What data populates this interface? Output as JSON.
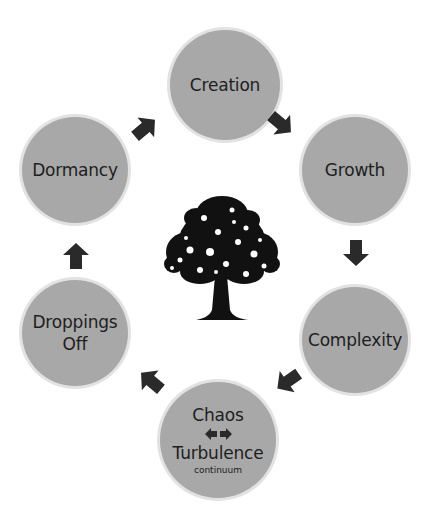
{
  "diagram": {
    "type": "cycle",
    "center_icon": "tree-icon",
    "colors": {
      "node_fill": "#a8a8a8",
      "node_ring": "#e2e2e2",
      "arrow": "#2a2a2a",
      "text": "#1e1e1e"
    },
    "nodes": [
      {
        "id": "creation",
        "label": "Creation"
      },
      {
        "id": "growth",
        "label": "Growth"
      },
      {
        "id": "complexity",
        "label": "Complexity"
      },
      {
        "id": "chaos",
        "label": "Chaos",
        "label2": "Turbulence",
        "sublabel": "continuum",
        "connector": "double-arrow-icon"
      },
      {
        "id": "droppings",
        "label": "Droppings",
        "label2": "Off"
      },
      {
        "id": "dormancy",
        "label": "Dormancy"
      }
    ],
    "edges": [
      {
        "from": "creation",
        "to": "growth"
      },
      {
        "from": "growth",
        "to": "complexity"
      },
      {
        "from": "complexity",
        "to": "chaos"
      },
      {
        "from": "chaos",
        "to": "droppings"
      },
      {
        "from": "droppings",
        "to": "dormancy"
      },
      {
        "from": "dormancy",
        "to": "creation"
      }
    ]
  }
}
